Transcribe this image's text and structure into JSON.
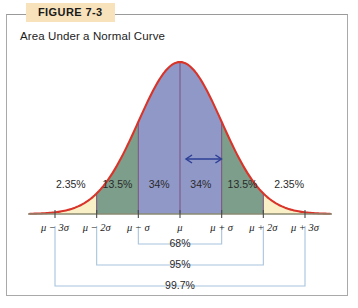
{
  "figure": {
    "tag": "FIGURE 7-3",
    "caption": "Area Under a Normal Curve"
  },
  "colors": {
    "tag_background": "#f7e2bb",
    "frame_border": "#a9a9a9",
    "curve_stroke": "#d8342a",
    "tail_fill": "#faf0c8",
    "mid_fill": "#7d9e8a",
    "center_fill": "#9098c8",
    "axis_line": "#8a8a72",
    "divider_line": "#7a4f7a",
    "bracket_line": "#a8c4dd",
    "arrow": "#2d3f96"
  },
  "chart_data": {
    "type": "area",
    "title": "Area Under a Normal Curve",
    "xlabel": "",
    "ylabel": "",
    "distribution": "normal",
    "grid": false,
    "legend": false,
    "xlim": [
      -3.6,
      3.6
    ],
    "x_ticks": [
      -3,
      -2,
      -1,
      0,
      1,
      2,
      3
    ],
    "x_tick_labels": [
      "μ − 3σ",
      "μ − 2σ",
      "μ − σ",
      "μ",
      "μ + σ",
      "μ + 2σ",
      "μ + 3σ"
    ],
    "regions": [
      {
        "label": "2.35%",
        "value": 2.35,
        "from": -3,
        "to": -2,
        "color": "#faf0c8",
        "center": -2.5
      },
      {
        "label": "13.5%",
        "value": 13.5,
        "from": -2,
        "to": -1,
        "color": "#7d9e8a",
        "center": -1.5
      },
      {
        "label": "34%",
        "value": 34,
        "from": -1,
        "to": 0,
        "color": "#9098c8",
        "center": -0.5
      },
      {
        "label": "34%",
        "value": 34,
        "from": 0,
        "to": 1,
        "color": "#9098c8",
        "center": 0.5
      },
      {
        "label": "13.5%",
        "value": 13.5,
        "from": 1,
        "to": 2,
        "color": "#7d9e8a",
        "center": 1.5
      },
      {
        "label": "2.35%",
        "value": 2.35,
        "from": 2,
        "to": 3,
        "color": "#faf0c8",
        "center": 2.5
      }
    ],
    "brackets": [
      {
        "label": "68%",
        "value": 68,
        "from": -1,
        "to": 1
      },
      {
        "label": "95%",
        "value": 95,
        "from": -2,
        "to": 2
      },
      {
        "label": "99.7%",
        "value": 99.7,
        "from": -3,
        "to": 3
      }
    ],
    "annotations": [
      {
        "name": "double-arrow",
        "from": 0.0,
        "to": 0.85,
        "shape": "double-headed-arrow"
      }
    ]
  }
}
